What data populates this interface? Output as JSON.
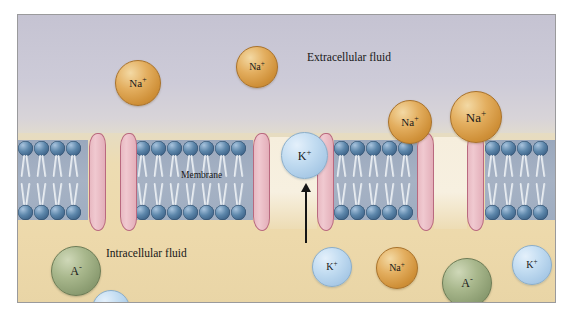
{
  "figure": {
    "regions": [
      {
        "name": "extracellular",
        "label": "Extracellular fluid",
        "color": "#c8c6d4"
      },
      {
        "name": "intracellular",
        "label": "Intracellular fluid",
        "color": "#edd9ab"
      },
      {
        "name": "membrane",
        "label": "Membrane",
        "color": "#9fadc1"
      }
    ],
    "colors": {
      "extracellular_fluid": "#c8c6d4",
      "intracellular_fluid": "#edd9ab",
      "membrane_band": "#9fadc1",
      "phospholipid_head": "#4a7399",
      "phospholipid_tail": "#eef2f6",
      "protein_channel": "#e8b9c2",
      "protein_outline": "#b9697f",
      "sodium_ion": "#d89a42",
      "potassium_ion": "#bcd9f0",
      "anion": "#93a57a",
      "arrow": "#151515",
      "panel_border": "#9a9a9c"
    },
    "labels": {
      "extracellular": "Extracellular fluid",
      "intracellular": "Intracellular fluid",
      "membrane": "Membrane"
    },
    "ion_species": {
      "sodium": {
        "symbol": "Na",
        "charge": "+",
        "name": "sodium-ion"
      },
      "potassium": {
        "symbol": "K",
        "charge": "+",
        "name": "potassium-ion"
      },
      "anion": {
        "symbol": "A",
        "charge": "-",
        "name": "anion"
      }
    },
    "ions": [
      {
        "id": "na-extra-1",
        "species": "sodium",
        "symbol": "Na",
        "charge": "+",
        "x": 97,
        "y": 45,
        "size": 44,
        "compartment": "extracellular"
      },
      {
        "id": "na-extra-2",
        "species": "sodium",
        "symbol": "Na",
        "charge": "+",
        "x": 218,
        "y": 31,
        "size": 40,
        "compartment": "extracellular"
      },
      {
        "id": "na-channel-1",
        "species": "sodium",
        "symbol": "Na",
        "charge": "+",
        "x": 370,
        "y": 85,
        "size": 42,
        "compartment": "extracellular"
      },
      {
        "id": "na-channel-2",
        "species": "sodium",
        "symbol": "Na",
        "charge": "+",
        "x": 432,
        "y": 76,
        "size": 50,
        "compartment": "extracellular"
      },
      {
        "id": "k-channel-up",
        "species": "potassium",
        "symbol": "K",
        "charge": "+",
        "x": 263,
        "y": 117,
        "size": 45,
        "compartment": "membrane-pore"
      },
      {
        "id": "a-intra-1",
        "species": "anion",
        "symbol": "A",
        "charge": "-",
        "x": 33,
        "y": 231,
        "size": 48,
        "compartment": "intracellular"
      },
      {
        "id": "k-intra-1",
        "species": "potassium",
        "symbol": "K",
        "charge": "+",
        "x": 74,
        "y": 275,
        "size": 36,
        "compartment": "intracellular"
      },
      {
        "id": "k-intra-2",
        "species": "potassium",
        "symbol": "K",
        "charge": "+",
        "x": 294,
        "y": 232,
        "size": 38,
        "compartment": "intracellular"
      },
      {
        "id": "na-intra-1",
        "species": "sodium",
        "symbol": "Na",
        "charge": "+",
        "x": 358,
        "y": 232,
        "size": 40,
        "compartment": "intracellular"
      },
      {
        "id": "a-intra-2",
        "species": "anion",
        "symbol": "A",
        "charge": "-",
        "x": 424,
        "y": 243,
        "size": 48,
        "compartment": "intracellular"
      },
      {
        "id": "k-intra-3",
        "species": "potassium",
        "symbol": "K",
        "charge": "+",
        "x": 494,
        "y": 230,
        "size": 38,
        "compartment": "intracellular"
      }
    ],
    "arrow": {
      "name": "potassium-efflux-arrow",
      "direction": "up",
      "x": 287,
      "y_top": 168,
      "y_bottom": 228
    },
    "bilayer_segments": [
      {
        "id": "seg-1",
        "x": 0,
        "width": 70,
        "lipids": 4
      },
      {
        "id": "seg-2",
        "x": 117,
        "width": 118,
        "lipids": 7
      },
      {
        "id": "seg-3",
        "x": 316,
        "width": 83,
        "lipids": 5
      },
      {
        "id": "seg-4",
        "x": 467,
        "width": 72,
        "lipids": 4
      }
    ],
    "proteins": [
      {
        "id": "protein-1",
        "x": 71,
        "name": "channel-protein-left-a"
      },
      {
        "id": "protein-2",
        "x": 102,
        "name": "channel-protein-left-b"
      },
      {
        "id": "protein-3",
        "x": 235,
        "name": "channel-protein-potassium-left"
      },
      {
        "id": "protein-4",
        "x": 299,
        "name": "channel-protein-potassium-right"
      },
      {
        "id": "protein-5",
        "x": 399,
        "name": "channel-protein-sodium-left"
      },
      {
        "id": "protein-6",
        "x": 449,
        "name": "channel-protein-sodium-right"
      }
    ],
    "pores": [
      {
        "id": "pore-potassium",
        "x": 252,
        "width": 47
      },
      {
        "id": "pore-sodium",
        "x": 416,
        "width": 33
      }
    ]
  }
}
